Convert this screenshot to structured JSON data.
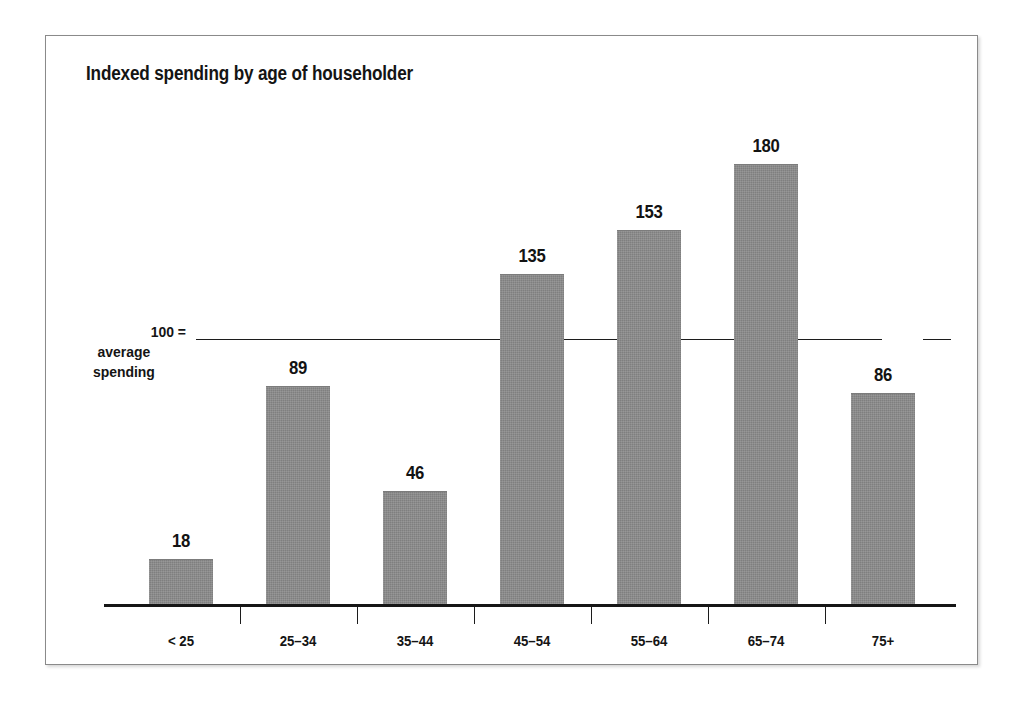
{
  "chart_data": {
    "type": "bar",
    "title": "Indexed spending by age of householder",
    "xlabel": "",
    "ylabel": "",
    "categories": [
      "< 25",
      "25–34",
      "35–44",
      "45–54",
      "55–64",
      "65–74",
      "75+"
    ],
    "values": [
      18,
      89,
      46,
      135,
      153,
      180,
      86
    ],
    "value_labels": [
      "18",
      "89",
      "46",
      "135",
      "153",
      "180",
      "86"
    ],
    "ylim": [
      0,
      190
    ],
    "grid": false,
    "legend": null,
    "reference_line": {
      "value": 100,
      "label_line1": "100 =",
      "label_line2": "average",
      "label_line3": "spending"
    },
    "colors": {
      "bar_fill": "#8b8b8b",
      "axis": "#161616",
      "text": "#131313",
      "frame": "#8a8a8a",
      "background": "#ffffff"
    }
  }
}
